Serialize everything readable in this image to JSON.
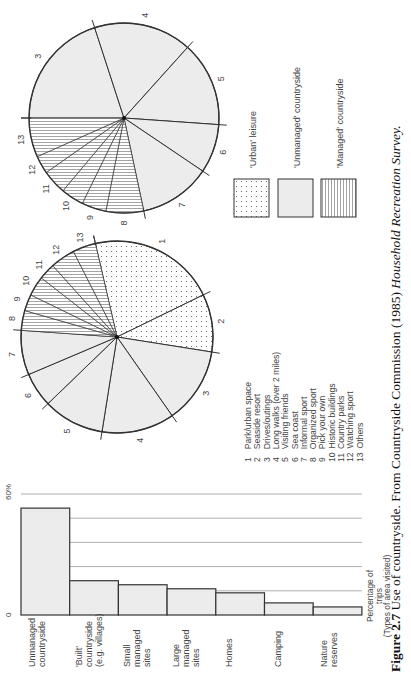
{
  "figure": {
    "caption_label": "Figure 2.7",
    "caption_text": " Use of countryside. From Countryside Commission (1985) ",
    "caption_source": "Household Recreation Survey."
  },
  "colors": {
    "urban": "#ffffff",
    "unmanaged": "#ececec",
    "managed": "#ffffff",
    "stroke": "#333333",
    "grid": "#9a9a9a"
  },
  "pie_legend": {
    "items": [
      {
        "n": "1",
        "label": "Park/urban space"
      },
      {
        "n": "2",
        "label": "Seaside resort"
      },
      {
        "n": "3",
        "label": "Drives/outings"
      },
      {
        "n": "4",
        "label": "Long walks (over 2 miles)"
      },
      {
        "n": "5",
        "label": "Visiting friends"
      },
      {
        "n": "6",
        "label": "Sea coast"
      },
      {
        "n": "7",
        "label": "Informal sport"
      },
      {
        "n": "8",
        "label": "Organized sport"
      },
      {
        "n": "9",
        "label": "Pick your own"
      },
      {
        "n": "10",
        "label": "Historic buildings"
      },
      {
        "n": "11",
        "label": "Country parks"
      },
      {
        "n": "12",
        "label": "Watching sport"
      },
      {
        "n": "13",
        "label": "Others"
      }
    ]
  },
  "category_legend": [
    {
      "key": "urban",
      "label": "'Urban' leisure"
    },
    {
      "key": "unmanaged",
      "label": "'Unmanaged' countryside"
    },
    {
      "key": "managed",
      "label": "'Managed' countryside"
    }
  ],
  "chart_data": [
    {
      "type": "pie",
      "title": "Pie A (all trips, with urban leisure)",
      "slices": [
        {
          "n": "1",
          "label": "Park/urban space",
          "category": "urban",
          "degrees": 77
        },
        {
          "n": "2",
          "label": "Seaside resort",
          "category": "urban",
          "degrees": 35
        },
        {
          "n": "3",
          "label": "Drives/outings",
          "category": "unmanaged",
          "degrees": 46
        },
        {
          "n": "4",
          "label": "Long walks (over 2 miles)",
          "category": "unmanaged",
          "degrees": 44
        },
        {
          "n": "5",
          "label": "Visiting friends",
          "category": "unmanaged",
          "degrees": 37
        },
        {
          "n": "6",
          "label": "Sea coast",
          "category": "unmanaged",
          "degrees": 21
        },
        {
          "n": "7",
          "label": "Informal sport",
          "category": "unmanaged",
          "degrees": 27
        },
        {
          "n": "8",
          "label": "Organized sport",
          "category": "managed",
          "degrees": 12
        },
        {
          "n": "9",
          "label": "Pick your own",
          "category": "managed",
          "degrees": 10
        },
        {
          "n": "10",
          "label": "Historic buildings",
          "category": "managed",
          "degrees": 12
        },
        {
          "n": "11",
          "label": "Country parks",
          "category": "managed",
          "degrees": 10
        },
        {
          "n": "12",
          "label": "Watching sport",
          "category": "managed",
          "degrees": 15
        },
        {
          "n": "13",
          "label": "Others",
          "category": "managed",
          "degrees": 14
        }
      ],
      "start_angle_screen_deg": 347
    },
    {
      "type": "pie",
      "title": "Pie B (countryside trips only)",
      "slices": [
        {
          "n": "3",
          "label": "Drives/outings",
          "category": "unmanaged",
          "degrees": 72
        },
        {
          "n": "4",
          "label": "Long walks (over 2 miles)",
          "category": "unmanaged",
          "degrees": 60
        },
        {
          "n": "5",
          "label": "Visiting friends",
          "category": "unmanaged",
          "degrees": 52
        },
        {
          "n": "6",
          "label": "Sea coast",
          "category": "unmanaged",
          "degrees": 30
        },
        {
          "n": "7",
          "label": "Informal sport",
          "category": "unmanaged",
          "degrees": 44
        },
        {
          "n": "8",
          "label": "Organized sport",
          "category": "managed",
          "degrees": 23
        },
        {
          "n": "9",
          "label": "Pick your own",
          "category": "managed",
          "degrees": 15
        },
        {
          "n": "10",
          "label": "Historic buildings",
          "category": "managed",
          "degrees": 14
        },
        {
          "n": "11",
          "label": "Country parks",
          "category": "managed",
          "degrees": 15
        },
        {
          "n": "12",
          "label": "Watching sport",
          "category": "managed",
          "degrees": 11
        },
        {
          "n": "13",
          "label": "Others",
          "category": "managed",
          "degrees": 24
        }
      ],
      "start_angle_screen_deg": 270
    },
    {
      "type": "bar",
      "title": "Percentage of trips (Types of area visited)",
      "categories": [
        "Unmanaged countryside",
        "'Built' countryside (e.g. villages)",
        "Small managed sites",
        "Large managed sites",
        "Homes",
        "Camping",
        "Nature reserves"
      ],
      "category_lines": [
        [
          "Unmanaged",
          "countryside"
        ],
        [
          "'Built'",
          "countryside",
          "(e.g. villages)"
        ],
        [
          "Small",
          "managed",
          "sites"
        ],
        [
          "Large",
          "managed",
          "sites"
        ],
        [
          "Homes"
        ],
        [
          "Camping"
        ],
        [
          "Nature",
          "reserves"
        ]
      ],
      "values": [
        53,
        17,
        15,
        13,
        11,
        6,
        4
      ],
      "xlabel": "",
      "ylabel": "Percentage of trips (Types of area visited)",
      "ylabel_lines": [
        "Percentage of",
        "trips",
        "(Types of area visited)"
      ],
      "ylim": [
        0,
        60
      ],
      "tick_labels": [
        "0",
        "60%"
      ],
      "gridlines": [
        12,
        24,
        36,
        48,
        60
      ],
      "grid": true
    }
  ]
}
